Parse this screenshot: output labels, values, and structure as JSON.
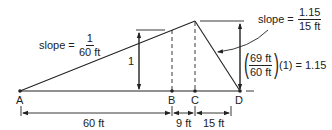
{
  "diagram": {
    "points": [
      {
        "label": "A"
      },
      {
        "label": "B"
      },
      {
        "label": "C"
      },
      {
        "label": "D"
      }
    ],
    "left_slope": {
      "prefix": "slope =",
      "numerator": "1",
      "denominator": "60 ft"
    },
    "right_slope": {
      "prefix": "slope =",
      "numerator": "1.15",
      "denominator": "15 ft"
    },
    "height_label": "1",
    "ratio_expression": {
      "numerator": "69 ft",
      "denominator": "60 ft",
      "suffix": "(1) = 1.15"
    },
    "dimensions": [
      {
        "label": "60 ft"
      },
      {
        "label": "9 ft"
      },
      {
        "label": "15 ft"
      }
    ],
    "colors": {
      "line": "#222222",
      "background": "#ffffff"
    }
  }
}
